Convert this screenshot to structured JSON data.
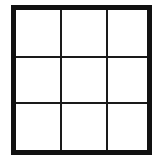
{
  "game": {
    "type": "tic-tac-toe",
    "rows": 3,
    "cols": 3,
    "border_color": "#111111",
    "line_color": "#1a1a1a",
    "background": "#ffffff",
    "cells": [
      "",
      "",
      "",
      "",
      "",
      "",
      "",
      "",
      ""
    ]
  }
}
